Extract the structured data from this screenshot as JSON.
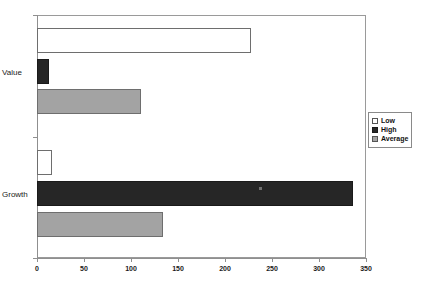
{
  "chart_data": {
    "type": "bar",
    "orientation": "horizontal",
    "title": "",
    "xlabel": "",
    "ylabel": "",
    "categories": [
      "Value",
      "Growth"
    ],
    "series": [
      {
        "name": "Low",
        "color": "#ffffff",
        "values": [
          228,
          16
        ]
      },
      {
        "name": "High",
        "color": "#262626",
        "values": [
          13,
          336
        ]
      },
      {
        "name": "Average",
        "color": "#a3a3a3",
        "values": [
          111,
          134
        ]
      }
    ],
    "xlim": [
      0,
      350
    ],
    "xticks": [
      0,
      50,
      100,
      150,
      200,
      250,
      300,
      350
    ],
    "xtick_labels": [
      "0",
      "50",
      "100",
      "150",
      "200",
      "250",
      "300",
      "350"
    ],
    "grid": false,
    "legend_position": "right"
  },
  "legend": {
    "items": [
      {
        "label": "Low"
      },
      {
        "label": "High"
      },
      {
        "label": "Average"
      }
    ]
  },
  "axis": {
    "category_labels": [
      "Value",
      "Growth"
    ],
    "tick_labels": [
      "0",
      "50",
      "100",
      "150",
      "200",
      "250",
      "300",
      "350"
    ]
  }
}
